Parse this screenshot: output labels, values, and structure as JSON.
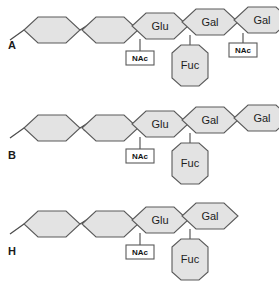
{
  "figure": {
    "type": "glycan-structure-diagram",
    "background_color": "#ffffff",
    "hexagon_fill": "#e3e3e3",
    "hexagon_stroke": "#5a5a5a",
    "bond_color": "#4a4a4a",
    "text_color": "#1d1d1d"
  },
  "panels": [
    {
      "id": "panel-a",
      "label": "A",
      "backbone": [
        {
          "name": "hex-1",
          "label": ""
        },
        {
          "name": "hex-2",
          "label": ""
        },
        {
          "name": "hex-3",
          "label": "Glu"
        },
        {
          "name": "hex-4",
          "label": "Gal"
        },
        {
          "name": "hex-5",
          "label": "Gal"
        }
      ],
      "break_after_index": 0,
      "branches": [
        {
          "from": "hex-3",
          "kind": "nac-box",
          "label": "NAc"
        },
        {
          "from": "hex-4",
          "kind": "hexagon",
          "label": "Fuc"
        },
        {
          "from": "hex-5",
          "kind": "nac-box",
          "label": "NAc"
        }
      ]
    },
    {
      "id": "panel-b",
      "label": "B",
      "backbone": [
        {
          "name": "hex-1",
          "label": ""
        },
        {
          "name": "hex-2",
          "label": ""
        },
        {
          "name": "hex-3",
          "label": "Glu"
        },
        {
          "name": "hex-4",
          "label": "Gal"
        },
        {
          "name": "hex-5",
          "label": "Gal"
        }
      ],
      "break_after_index": 0,
      "branches": [
        {
          "from": "hex-3",
          "kind": "nac-box",
          "label": "NAc"
        },
        {
          "from": "hex-4",
          "kind": "hexagon",
          "label": "Fuc"
        }
      ]
    },
    {
      "id": "panel-h",
      "label": "H",
      "backbone": [
        {
          "name": "hex-1",
          "label": ""
        },
        {
          "name": "hex-2",
          "label": ""
        },
        {
          "name": "hex-3",
          "label": "Glu"
        },
        {
          "name": "hex-4",
          "label": "Gal"
        }
      ],
      "break_after_index": 0,
      "branches": [
        {
          "from": "hex-3",
          "kind": "nac-box",
          "label": "NAc"
        },
        {
          "from": "hex-4",
          "kind": "hexagon",
          "label": "Fuc"
        }
      ]
    }
  ]
}
